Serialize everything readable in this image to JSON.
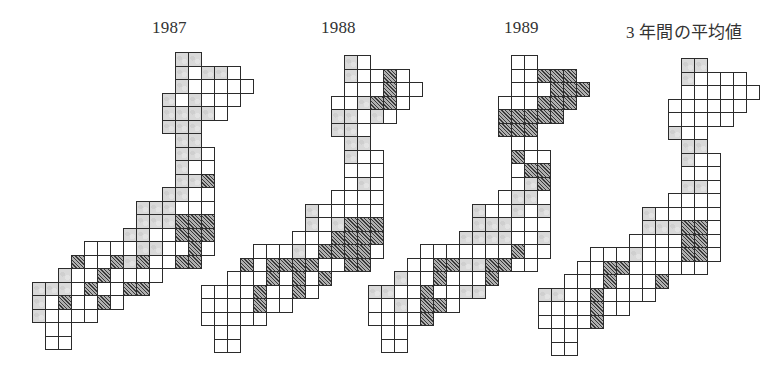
{
  "figure": {
    "legend_note": "G = light gray (stippled) cell, H = dark hatched cell, W = white cell",
    "colors": {
      "gray": "#d9d9d9",
      "hatched": "#5a5a5a",
      "white": "#ffffff",
      "border": "#2b2b2b"
    },
    "maps": [
      {
        "title": "1987",
        "origin_x": 32,
        "origin_y": 52,
        "title_x": 152,
        "title_y": 18,
        "rows": [
          "11G 12G",
          "11G 12W 13G 14G 15W",
          "11G 12W 13W 14W 15W 16W",
          "10G 11W 12G 13W 14W 15W",
          "10G 11G 12G 13G 14W",
          "10G 11G 12G",
          "11G 12G",
          "11G 12G 13W",
          "11G 12W 13W",
          "11G 12G 13H",
          "10G 11G 12W 13W",
          "8G 9G 10G 11W 12W 13W",
          "8G 9G 10G 11H 12H 13H",
          "7G 8G 9W 10W 11H 12H 13H",
          "4W 5W 6W 7W 8G 9G 10W 11W 12H 13W",
          "3H 4W 5W 6H 7G 8H 9W 10W 11H 12H",
          "2G 3W 4W 5H 6W 7W 8W 9W",
          "0G 1G 2G 3W 4H 5W 6W 7H 8H",
          "0G 1W 2H 3W 4W 5H 6W",
          "0G 1W 2W 3W 4W",
          "1W 2W",
          "1W 2W"
        ]
      },
      {
        "title": "1988",
        "origin_x": 201,
        "origin_y": 55,
        "title_x": 321,
        "title_y": 18,
        "rows": [
          "11G 12W",
          "11G 12W 13W 14H 15W",
          "11W 12W 13W 14H 15W 16W",
          "10W 11W 12G 13H 14H 15W",
          "10G 11G 12W 13G 14W",
          "10G 11G 12W",
          "11G 12G",
          "11G 12W 13W",
          "11W 12W 13W",
          "11W 12G 13W",
          "10W 11W 12W 13W",
          "8G 9W 10W 11W 12W 13W",
          "8G 9W 10G 11H 12H 13H",
          "7W 8W 9W 10H 11H 12H 13H",
          "4W 5W 6W 7G 8W 9H 10H 11H 12H 13W",
          "3H 4W 5H 6H 7H 8H 9W 10W 11H 12H",
          "2W 3W 4W 5H 6W 7H 8W 9H",
          "0W 1W 2W 3W 4H 5W 6W 7H 8W",
          "0W 1W 2W 3W 4H 5W 6W",
          "0W 1W 2W 3W 4W",
          "1W 2W",
          "1W 2W"
        ]
      },
      {
        "title": "1989",
        "origin_x": 368,
        "origin_y": 55,
        "title_x": 504,
        "title_y": 18,
        "rows": [
          "11W 12W",
          "11W 12W 13H 14H 15H",
          "11W 12W 13W 14H 15H 16H",
          "10W 11W 12W 13H 14H 15H",
          "10H 11H 12H 13H 14H",
          "10H 11H 12H",
          "11W 12W",
          "11H 12W 13W",
          "11W 12H 13H",
          "11W 12G 13H",
          "10W 11G 12G 13W",
          "8G 9W 10W 11G 12W 13G",
          "8G 9G 10G 11W 12W 13W",
          "7G 8G 9G 10G 11W 12W 13G",
          "4W 5W 6W 7W 8W 9W 10W 11H 12W 13W",
          "3W 4W 5H 6H 7G 8G 9H 10H 11W 12W",
          "2G 3W 4W 5H 6W 7W 8W 9H",
          "0G 1G 2W 3W 4H 5W 6W 7G 8G",
          "0W 1W 2G 3W 4H 5H 6W",
          "0W 1W 2W 3W 4H",
          "1W 2W",
          "1W 2W"
        ]
      },
      {
        "title": "3 年間の平均値",
        "origin_x": 538,
        "origin_y": 58,
        "title_x": 626,
        "title_y": 18,
        "rows": [
          "11G 12G",
          "11G 12W 13W 14W 15W",
          "11W 12W 13W 14W 15W 16W",
          "10W 11W 12W 13W 14W 15W",
          "10W 11W 12W 13W 14W",
          "10G 11W 12W",
          "11G 12G",
          "11G 12W 13W",
          "11W 12W 13W",
          "11G 12G 13W",
          "10W 11W 12W 13W",
          "8G 9W 10W 11W 12W 13W",
          "8G 9G 10G 11H 12H 13W",
          "7W 8W 9W 10W 11H 12H 13W",
          "4W 5W 6W 7G 8W 9W 10W 11H 12H 13W",
          "3W 4W 5H 6H 7W 8W 9W 10W 11W 12W",
          "2W 3W 4W 5H 6W 7W 8W 9H",
          "0G 1G 2W 3W 4H 5W 6W 7W 8W",
          "0W 1W 2W 3W 4H 5W 6W",
          "0W 1W 2W 3W 4H",
          "1W 2W",
          "1W 2W"
        ]
      }
    ],
    "cell_width": 13,
    "cell_height": 13.5
  }
}
